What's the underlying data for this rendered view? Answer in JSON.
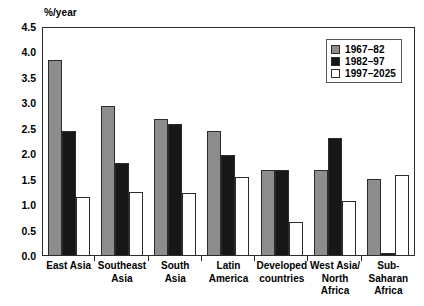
{
  "chart_data": {
    "type": "bar",
    "title": "",
    "subtitle": "",
    "xlabel": "",
    "ylabel": "%/year",
    "ylim": [
      0,
      4.5
    ],
    "ytick_labels": [
      "4.5",
      "4.0",
      "3.5",
      "3.0",
      "2.5",
      "2.0",
      "1.5",
      "1.0",
      "0.5",
      "0.0"
    ],
    "ytick_values": [
      4.5,
      4.0,
      3.5,
      3.0,
      2.5,
      2.0,
      1.5,
      1.0,
      0.5,
      0.0
    ],
    "grid": false,
    "legend_position": "top-right",
    "categories": [
      "East Asia",
      "Southeast\nAsia",
      "South Asia",
      "Latin\nAmerica",
      "Developed\ncountries",
      "West Asia/\nNorth\nAfrica",
      "Sub-\nSaharan\nAfrica"
    ],
    "series": [
      {
        "name": "1967–82",
        "color": "#8d8d8d",
        "values": [
          3.85,
          2.95,
          2.7,
          2.46,
          1.7,
          1.7,
          1.51
        ]
      },
      {
        "name": "1982–97",
        "color": "#17171a",
        "values": [
          2.45,
          1.82,
          2.59,
          1.98,
          1.69,
          2.32,
          0.06
        ]
      },
      {
        "name": "1997–2025",
        "color": "#ffffff",
        "values": [
          1.15,
          1.25,
          1.24,
          1.56,
          0.67,
          1.08,
          1.6
        ]
      }
    ]
  },
  "colors": {
    "series_1967_82": "#8d8d8d",
    "series_1982_97": "#17171a",
    "series_1997_2025": "#ffffff",
    "axis": "#2b2b2b",
    "background": "#ffffff"
  }
}
